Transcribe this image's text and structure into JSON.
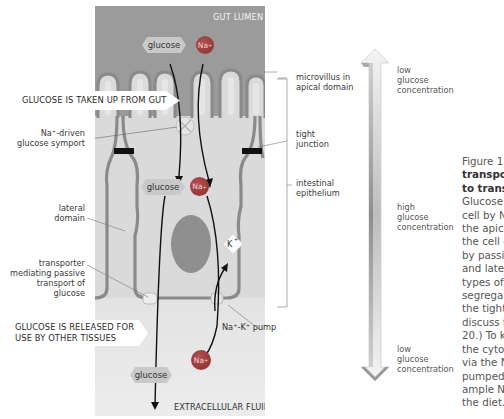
{
  "diagram": {
    "regions": {
      "gut_lumen": "GUT LUMEN",
      "extracellular_fluid": "EXTRACELLULAR FLUID"
    },
    "callouts": {
      "uptake": "GLUCOSE IS TAKEN UP FROM GUT",
      "release_line1": "GLUCOSE IS RELEASED FOR",
      "release_line2": "USE BY OTHER TISSUES"
    },
    "left_labels": {
      "symport_line1": "Na⁺-driven",
      "symport_line2": "glucose symport",
      "lateral_line1": "lateral",
      "lateral_line2": "domain",
      "passive_line1": "transporter",
      "passive_line2": "mediating passive",
      "passive_line3": "transport of",
      "passive_line4": "glucose"
    },
    "right_labels": {
      "microvillus_line1": "microvillus in",
      "microvillus_line2": "apical domain",
      "tight_line1": "tight",
      "tight_line2": "junction",
      "epithelium_line1": "intestinal",
      "epithelium_line2": "epithelium",
      "pump": "Na⁺-K⁺ pump"
    },
    "molecules": {
      "glucose": "glucose",
      "sodium": "Na",
      "sodium_charge": "+",
      "potassium": "K⁺"
    },
    "colors": {
      "lumen_bg": "#9a9a9a",
      "cell_bg": "#dcdcdc",
      "membrane": "#8c8c8c",
      "nucleus": "#8e8e8e",
      "sodium": "#9a3a3a",
      "glucose": "#c8c8c8",
      "extracellular_bg": "#e4e4e4"
    }
  },
  "gradient_arrow": {
    "top_label_line1": "low",
    "top_label_line2": "glucose",
    "top_label_line3": "concentration",
    "middle_label_line1": "high",
    "middle_label_line2": "glucose",
    "middle_label_line3": "concentration",
    "bottom_label_line1": "low",
    "bottom_label_line2": "glucose",
    "bottom_label_line3": "concentration"
  },
  "caption": {
    "line1": "Figure 1",
    "line2_bold": "transpor",
    "line3_bold": "to transf",
    "lines": [
      "Glucose",
      "cell by N",
      "the apica",
      "the cell c",
      "by passiv",
      "and later",
      "types of",
      "segregat",
      "the tight",
      "discuss t",
      "20.) To ke",
      "the cytos",
      "via the N",
      "pumped",
      "ample N",
      "the diet."
    ]
  }
}
